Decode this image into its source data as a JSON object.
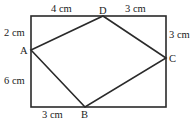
{
  "diagram": {
    "type": "geometry",
    "rectangle": {
      "x1": 31,
      "y1": 16,
      "x2": 166,
      "y2": 107
    },
    "points": {
      "A": {
        "label": "A",
        "x": 31,
        "y": 50
      },
      "B": {
        "label": "B",
        "x": 85,
        "y": 107
      },
      "C": {
        "label": "C",
        "x": 166,
        "y": 58
      },
      "D": {
        "label": "D",
        "x": 103,
        "y": 16
      }
    },
    "measurements": {
      "top_left": "4 cm",
      "top_right": "3 cm",
      "left_upper": "2 cm",
      "left_lower": "6 cm",
      "right_upper": "3 cm",
      "bottom_left": "3 cm"
    },
    "colors": {
      "line": "#2a2a2a",
      "text": "#222222"
    }
  }
}
